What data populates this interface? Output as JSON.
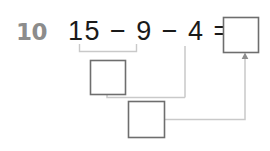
{
  "worksheet": {
    "question_number": "10",
    "equation": {
      "full_text": "15 − 9 − 4 =",
      "operand_1": "15",
      "operator_1": "−",
      "operand_2": "9",
      "operator_2": "−",
      "operand_3": "4",
      "equals": "="
    },
    "boxes": {
      "partial_sum_box": {
        "name": "first-step-answer-box",
        "value": "",
        "covers": "15 − 9"
      },
      "second_step_box": {
        "name": "second-step-answer-box",
        "value": "",
        "covers": "partial − 4"
      },
      "final_answer_box": {
        "name": "final-answer-box",
        "value": ""
      }
    },
    "bracket": {
      "label": "",
      "spans": "15 − 9"
    },
    "colors": {
      "question_number": "#8c8c8c",
      "text": "#1a1a1a",
      "box_border": "#6e6e6e",
      "connector_line": "#bdbdbd",
      "bracket_line": "#c4c4c4",
      "background": "#ffffff"
    }
  }
}
